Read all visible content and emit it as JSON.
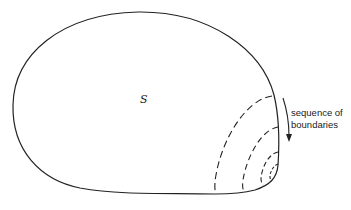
{
  "figure": {
    "region_label": "S",
    "caption_lines": [
      "sequence of",
      "boundaries"
    ],
    "stroke_color": "#222222",
    "background": "#ffffff",
    "dashed_boundary_count": 4,
    "arrow_direction": "down"
  }
}
